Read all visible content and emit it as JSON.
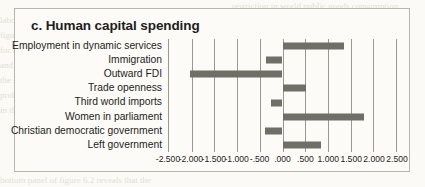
{
  "figure": {
    "title": "c. Human capital spending"
  },
  "chart_data": {
    "type": "bar",
    "orientation": "horizontal",
    "title": "c. Human capital spending",
    "xlabel": "",
    "ylabel": "",
    "grid": true,
    "legend": false,
    "xlim": [
      -2.5,
      2.5
    ],
    "xticks": [
      -2.5,
      -2.0,
      -1.5,
      -1.0,
      -0.5,
      0.0,
      0.5,
      1.0,
      1.5,
      2.0,
      2.5
    ],
    "xticklabels": [
      "-2.500",
      "-2.000",
      "-1.500",
      "-1.000",
      "-.500",
      ".000",
      ".500",
      "1.000",
      "1.500",
      "2.000",
      "2.500"
    ],
    "categories": [
      "Employment in dynamic services",
      "Immigration",
      "Outward FDI",
      "Trade openness",
      "Third world imports",
      "Women in parliament",
      "Christian democratic government",
      "Left government"
    ],
    "values": [
      1.35,
      -0.37,
      -2.04,
      0.52,
      -0.26,
      1.8,
      -0.39,
      0.84
    ],
    "bar_color": "#6f6f67"
  },
  "colors": {
    "bar": "#6f6f67",
    "gridline": "#9b988f",
    "border": "#b9b6ac",
    "background": "#fcfbf7",
    "text": "#1d1d1b"
  },
  "ghost_text": {
    "line1": "restriction in world public goods consumption",
    "line2": "labour trade, capital, and migration",
    "line3": "figure 6.2 indicates that the 'deep' export of",
    "line4": "for the employment in dynamic services a rising",
    "line5": "and dependent is concerned, and the export of",
    "line6": "the implications of capital mobility under the influence",
    "line7": "problems with fiscal and political, it is striking",
    "line8": "in the case of capital human spending, however, the",
    "line9": "bottom panel of figure 6.2 reveals that the"
  }
}
